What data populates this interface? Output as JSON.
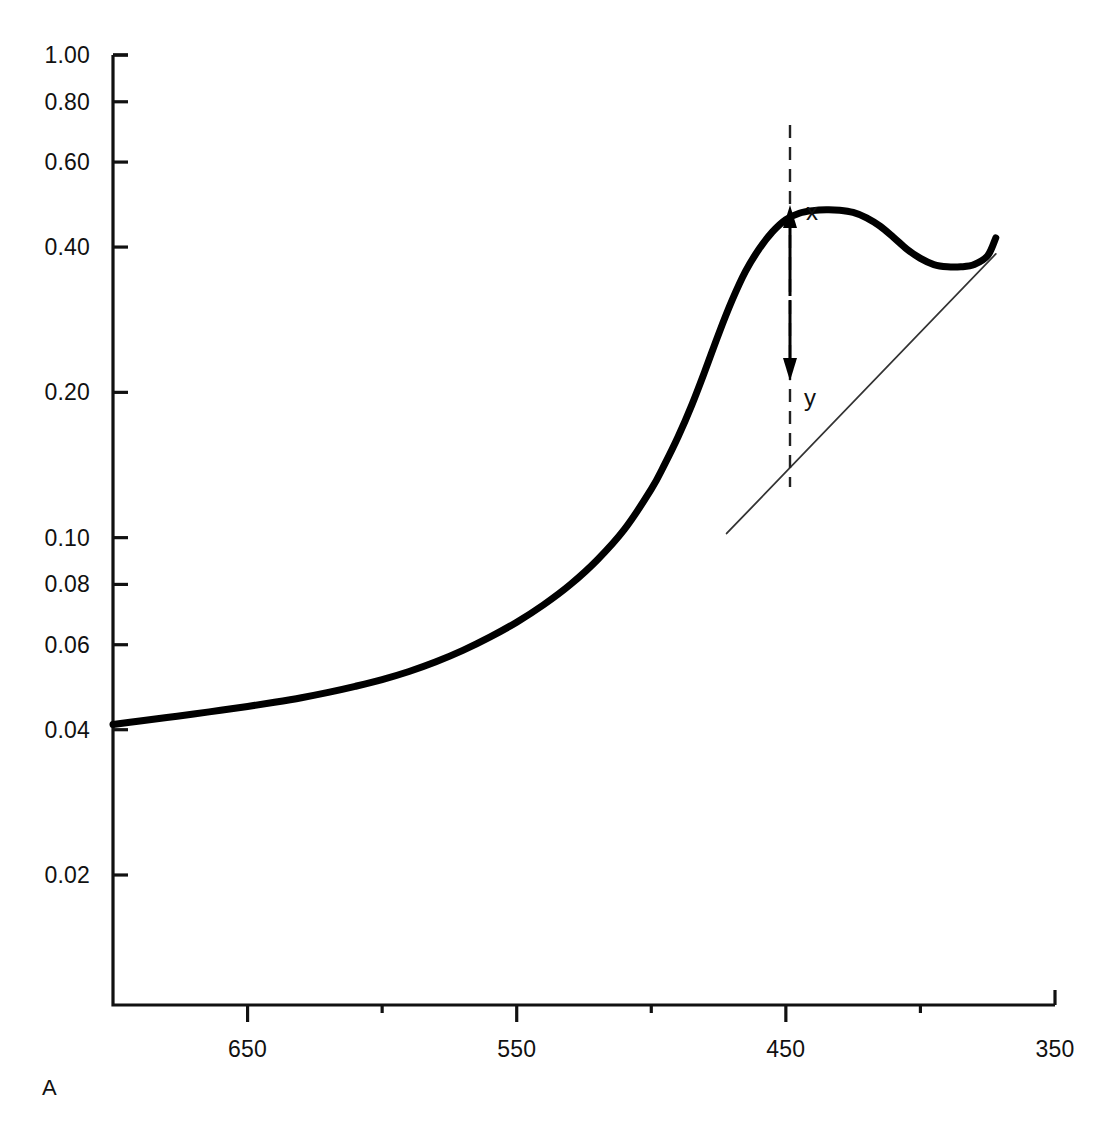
{
  "figure": {
    "panel_label": "A",
    "background_color": "#ffffff",
    "curve_color": "#000000",
    "baseline_color": "#333333",
    "axis_color": "#111111"
  },
  "annotations": [
    {
      "name": "peak-height-marker",
      "label": "x",
      "x_px": 806,
      "y_px": 198
    },
    {
      "name": "baseline-marker",
      "label": "y",
      "x_px": 804,
      "y_px": 384
    }
  ],
  "chart_data": {
    "type": "line",
    "title": "",
    "subtitle": "",
    "xlabel": "",
    "ylabel": "",
    "grid": false,
    "legend": false,
    "yscale": "log",
    "xscale": "linear",
    "xlim": [
      700,
      350
    ],
    "ylim": [
      0.0125,
      1.0
    ],
    "x_tick_labels": [
      "650",
      "550",
      "450",
      "350"
    ],
    "x_ticks_major": [
      650,
      550,
      450,
      350
    ],
    "x_ticks_minor": [
      600,
      500,
      400
    ],
    "y_tick_labels": [
      "1.00",
      "0.80",
      "0.60",
      "0.40",
      "0.20",
      "0.10",
      "0.08",
      "0.06",
      "0.04",
      "0.02"
    ],
    "y_ticks": [
      1.0,
      0.8,
      0.6,
      0.4,
      0.2,
      0.1,
      0.08,
      0.06,
      0.04,
      0.02
    ],
    "series": [
      {
        "name": "absorbance-scan",
        "style": "thick-solid",
        "x": [
          700,
          690,
          680,
          670,
          660,
          650,
          640,
          630,
          620,
          610,
          600,
          590,
          580,
          570,
          560,
          550,
          540,
          530,
          520,
          510,
          500,
          495,
          490,
          485,
          480,
          475,
          470,
          465,
          460,
          455,
          450,
          445,
          440,
          435,
          430,
          425,
          420,
          415,
          410,
          405,
          400,
          395,
          390,
          385,
          380,
          375,
          372
        ],
        "y": [
          0.041,
          0.0417,
          0.0424,
          0.0431,
          0.0439,
          0.0447,
          0.0456,
          0.0466,
          0.0478,
          0.0492,
          0.0508,
          0.0528,
          0.0553,
          0.0584,
          0.0622,
          0.0668,
          0.0726,
          0.08,
          0.09,
          0.104,
          0.126,
          0.142,
          0.162,
          0.188,
          0.222,
          0.264,
          0.31,
          0.356,
          0.396,
          0.43,
          0.456,
          0.47,
          0.476,
          0.478,
          0.477,
          0.472,
          0.46,
          0.442,
          0.419,
          0.396,
          0.379,
          0.368,
          0.364,
          0.364,
          0.368,
          0.384,
          0.418
        ]
      },
      {
        "name": "baseline-tangent",
        "style": "thin-solid",
        "x": [
          472,
          372
        ],
        "y": [
          0.102,
          0.387
        ]
      }
    ],
    "derived_values": {
      "peak_wavelength_nm": 435,
      "peak_absorbance_x": 0.478,
      "baseline_absorbance_y": 0.235,
      "marker_wavelength_nm": 450
    }
  }
}
